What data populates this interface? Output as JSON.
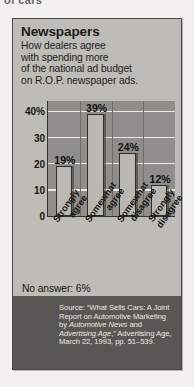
{
  "page": {
    "cut_off_text": "of cars"
  },
  "panel": {
    "title": "Newspapers",
    "subtitle_lines": [
      "How dealers agree",
      "with spending more",
      "of the national ad budget",
      "on R.O.P. newspaper ads."
    ],
    "no_answer": "No answer: 6%",
    "source_prefix": "Source: “What Sells Cars: A Joint Report on Automotive Marketing by ",
    "source_italic_1": "Automotive News",
    "source_mid": " and ",
    "source_italic_2": "Advertising Age",
    "source_suffix": ",” Advertising Age, March 22, 1993, pp. 51–539."
  },
  "colors": {
    "page_background": "#f2f1ee",
    "panel_background": "#bdbcb7",
    "panel_border": "#4a4a48",
    "plot_background": "#8f8e8a",
    "bar_fill": "#b9b8b3",
    "bar_outline": "#2c2c28",
    "gridline": "#eceae4",
    "source_band": "#585753",
    "source_text": "#eceae3",
    "text": "#1a1a1a"
  },
  "chart_data": {
    "type": "bar",
    "title": "Newspapers",
    "subtitle": "How dealers agree with spending more of the national ad budget on R.O.P. newspaper ads.",
    "categories": [
      "Strongly agree",
      "Somewhat agree",
      "Somewhat disagree",
      "Strongly disagree"
    ],
    "category_lines": [
      [
        "Strongly",
        "agree"
      ],
      [
        "Somewhat",
        "agree"
      ],
      [
        "Somewhat",
        "disagree"
      ],
      [
        "Strongly",
        "disagree"
      ]
    ],
    "values": [
      19,
      39,
      24,
      12
    ],
    "data_labels": [
      "19%",
      "39%",
      "24%",
      "12%"
    ],
    "xlabel": "",
    "ylabel": "",
    "ylim": [
      0,
      44
    ],
    "yticks": [
      0,
      10,
      20,
      30,
      40
    ],
    "ytick_labels": [
      "0",
      "10",
      "20",
      "30",
      "40%"
    ],
    "grid": true,
    "legend": "none",
    "annotations": [
      "No answer: 6%"
    ],
    "units": "percent"
  }
}
